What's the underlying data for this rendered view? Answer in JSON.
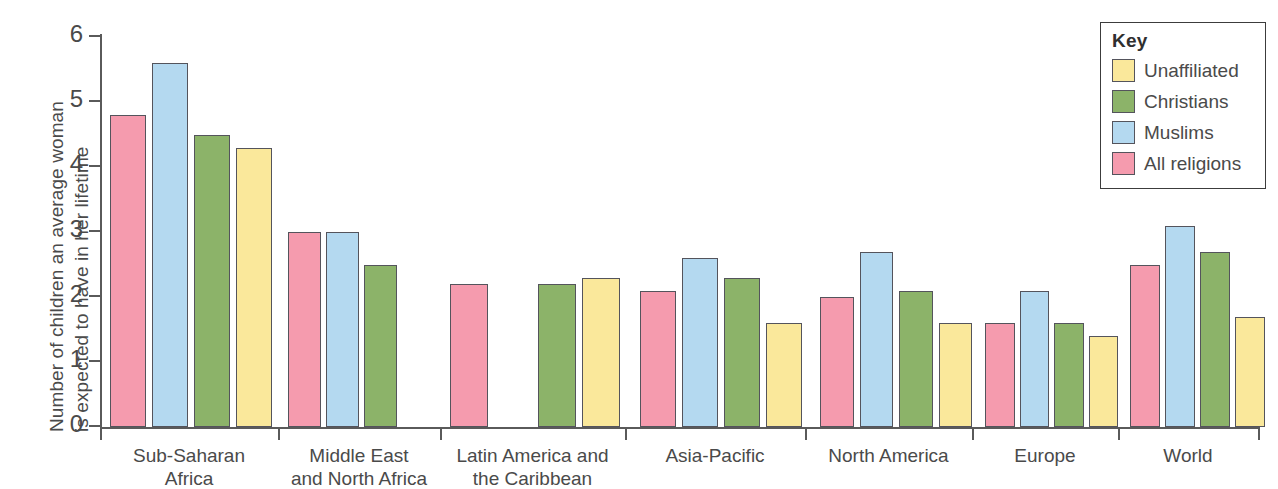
{
  "chart_data": {
    "type": "bar",
    "title": "",
    "xlabel": "",
    "ylabel_line1": "Number of children an average woman",
    "ylabel_line2": "is expected to have in her lifetime",
    "ylim": [
      0,
      6
    ],
    "yticks": [
      0,
      1,
      2,
      3,
      4,
      5,
      6
    ],
    "ytick_labels": [
      "0",
      "1",
      "2",
      "3",
      "4",
      "5",
      "6"
    ],
    "grid": false,
    "legend_position": "top-right",
    "legend_title": "Key",
    "categories": [
      "Sub-Saharan\nAfrica",
      "Middle East\nand North Africa",
      "Latin America and\nthe Caribbean",
      "Asia-Pacific",
      "North America",
      "Europe",
      "World"
    ],
    "category_lines": [
      [
        "Sub-Saharan",
        "Africa"
      ],
      [
        "Middle East",
        "and North Africa"
      ],
      [
        "Latin America and",
        "the Caribbean"
      ],
      [
        "Asia-Pacific",
        ""
      ],
      [
        "North America",
        ""
      ],
      [
        "Europe",
        ""
      ],
      [
        "World",
        ""
      ]
    ],
    "series": [
      {
        "name": "All religions",
        "color": "#F59BAE",
        "values": [
          4.8,
          3.0,
          2.2,
          2.1,
          2.0,
          1.6,
          2.5
        ]
      },
      {
        "name": "Muslims",
        "color": "#B4D9F0",
        "values": [
          5.6,
          3.0,
          null,
          2.6,
          2.7,
          2.1,
          3.1
        ]
      },
      {
        "name": "Christians",
        "color": "#8CB369",
        "values": [
          4.5,
          2.5,
          2.2,
          2.3,
          2.1,
          1.6,
          2.7
        ]
      },
      {
        "name": "Unaffiliated",
        "color": "#FAE89B",
        "values": [
          4.3,
          null,
          2.3,
          1.6,
          1.6,
          1.4,
          1.7
        ]
      }
    ],
    "legend_order": [
      "Unaffiliated",
      "Christians",
      "Muslims",
      "All religions"
    ],
    "legend_colors": {
      "Unaffiliated": "#FAE89B",
      "Christians": "#8CB369",
      "Muslims": "#B4D9F0",
      "All religions": "#F59BAE"
    }
  },
  "axis": {
    "line_color": "#5a5a5a",
    "text_color": "#4a4a4a"
  }
}
